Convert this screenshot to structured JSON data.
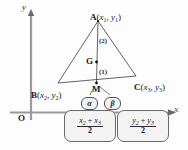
{
  "figure": {
    "axes": {
      "y_label": "y",
      "x_label": "x",
      "origin_label": "O"
    },
    "points": {
      "A": {
        "name": "A",
        "coord_open": "(",
        "x": "x",
        "x_sub": "1",
        "comma": ",",
        "y": "y",
        "y_sub": "1",
        "coord_close": ")"
      },
      "B": {
        "name": "B",
        "coord_open": "(",
        "x": "x",
        "x_sub": "2",
        "comma": ",",
        "y": "y",
        "y_sub": "2",
        "coord_close": ")"
      },
      "C": {
        "name": "C",
        "coord_open": "(",
        "x": "x",
        "x_sub": "3",
        "comma": ",",
        "y": "y",
        "y_sub": "3",
        "coord_close": ")"
      },
      "G": {
        "name": "G"
      },
      "M": {
        "name": "M"
      }
    },
    "ratio_labels": {
      "upper": "(2)",
      "lower": "(1)"
    },
    "badges": {
      "alpha": "α",
      "beta": "β"
    },
    "formulas": {
      "x_mid": {
        "numerator_first": "x",
        "numerator_first_sub": "2",
        "plus": "+",
        "numerator_second": "x",
        "numerator_second_sub": "3",
        "denominator": "2"
      },
      "y_mid": {
        "numerator_first": "y",
        "numerator_first_sub": "2",
        "plus": "+",
        "numerator_second": "y",
        "numerator_second_sub": "3",
        "denominator": "2"
      }
    },
    "colors": {
      "stroke": "#2b2b2b",
      "axis": "#8a8a8a",
      "box_fill": "#f3f3f3",
      "background": "#fdfdfd"
    }
  }
}
